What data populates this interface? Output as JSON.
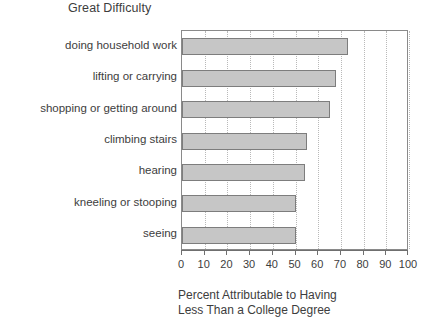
{
  "chart_data": {
    "type": "bar",
    "orientation": "horizontal",
    "title": "Great Difficulty",
    "xlabel_line1": "Percent Attributable to Having",
    "xlabel_line2": "Less Than a College Degree",
    "ylabel": "",
    "categories": [
      "doing household work",
      "lifting or carrying",
      "shopping or getting around",
      "climbing stairs",
      "hearing",
      "kneeling or stooping",
      "seeing"
    ],
    "values": [
      73,
      68,
      65,
      55,
      54,
      50,
      50
    ],
    "xlim": [
      0,
      100
    ],
    "xticks": [
      0,
      10,
      20,
      30,
      40,
      50,
      60,
      70,
      80,
      90,
      100
    ],
    "xtick_labels": [
      "0",
      "10",
      "20",
      "30",
      "40",
      "50",
      "60",
      "70",
      "80",
      "90",
      "100"
    ],
    "grid": "vertical-dotted",
    "legend": "none",
    "bar_fill_color": "#c6c6c6",
    "bar_border_color": "#7d7d7d",
    "gridline_color": "#b9b9b9",
    "axis_color": "#6f6f6f",
    "text_color": "#3d3d3d"
  }
}
